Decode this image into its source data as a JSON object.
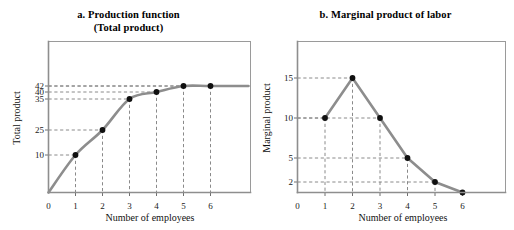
{
  "figure": {
    "background_color": "#ffffff",
    "curve_color": "#8d8d8d",
    "marker_color": "#101010",
    "guide_color": "#7d7d7d",
    "frame_color": "#9a9a9a"
  },
  "panels": [
    {
      "id": "a",
      "title_line1": "a. Production function",
      "title_line2": "(Total product)"
    },
    {
      "id": "b",
      "title_line1": "b. Marginal product of labor",
      "title_line2": ""
    }
  ],
  "chart_data": [
    {
      "type": "line",
      "title": "a. Production function (Total product)",
      "subtitle": "(Total product)",
      "xlabel": "Number of employees",
      "ylabel": "Total product",
      "x": [
        0,
        1,
        2,
        3,
        4,
        5,
        6
      ],
      "values": [
        0,
        10,
        25,
        35,
        40,
        42,
        42
      ],
      "categories": [
        "0",
        "1",
        "2",
        "3",
        "4",
        "5",
        "6"
      ],
      "xtick_labels": [
        "0",
        "1",
        "2",
        "3",
        "4",
        "5",
        "6"
      ],
      "ytick_labels": [
        "10",
        "25",
        "35",
        "40",
        "42"
      ],
      "ytick_values": [
        10,
        25,
        35,
        40,
        42
      ],
      "xlim": [
        0,
        6.9
      ],
      "ylim": [
        0,
        56
      ],
      "grid": false,
      "guides": "dashed leader lines from each marker to both axes",
      "legend": "none",
      "marker_points": [
        {
          "x": 1,
          "y": 10
        },
        {
          "x": 2,
          "y": 25
        },
        {
          "x": 3,
          "y": 35
        },
        {
          "x": 4,
          "y": 40
        },
        {
          "x": 5,
          "y": 42
        },
        {
          "x": 6,
          "y": 42
        }
      ]
    },
    {
      "type": "line",
      "title": "b. Marginal product of labor",
      "subtitle": "",
      "xlabel": "Number of employees",
      "ylabel": "Marginal product",
      "x": [
        1,
        2,
        3,
        4,
        5,
        6
      ],
      "values": [
        10,
        15,
        10,
        5,
        2,
        0
      ],
      "categories": [
        "1",
        "2",
        "3",
        "4",
        "5",
        "6"
      ],
      "xtick_labels": [
        "0",
        "1",
        "2",
        "3",
        "4",
        "5",
        "6"
      ],
      "ytick_labels": [
        "2",
        "5",
        "10",
        "15"
      ],
      "ytick_values": [
        2,
        5,
        10,
        15
      ],
      "xlim": [
        0,
        6.9
      ],
      "ylim": [
        0,
        21
      ],
      "grid": false,
      "guides": "dashed leader lines from each marker to both axes",
      "legend": "none",
      "marker_points": [
        {
          "x": 1,
          "y": 10
        },
        {
          "x": 2,
          "y": 15
        },
        {
          "x": 3,
          "y": 10
        },
        {
          "x": 4,
          "y": 5
        },
        {
          "x": 5,
          "y": 2
        },
        {
          "x": 6,
          "y": 0
        }
      ]
    }
  ]
}
